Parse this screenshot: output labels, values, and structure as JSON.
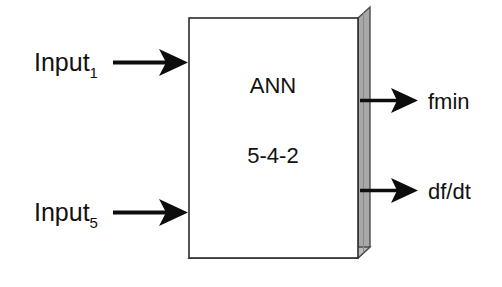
{
  "diagram": {
    "block": {
      "name": "ANN",
      "architecture_label": "5-4-2",
      "face_color": "#ffffff",
      "border_color": "#1a1a1a",
      "shadow_color": "#a8a8a8",
      "shadow_edge_color": "#6b6b6b"
    },
    "inputs": [
      {
        "label_base": "Input",
        "label_sub": "1"
      },
      {
        "label_base": "Input",
        "label_sub": "5"
      }
    ],
    "outputs": [
      {
        "label": "fmin"
      },
      {
        "label": "df/dt"
      }
    ],
    "arrow_color": "#0d0d0d"
  }
}
